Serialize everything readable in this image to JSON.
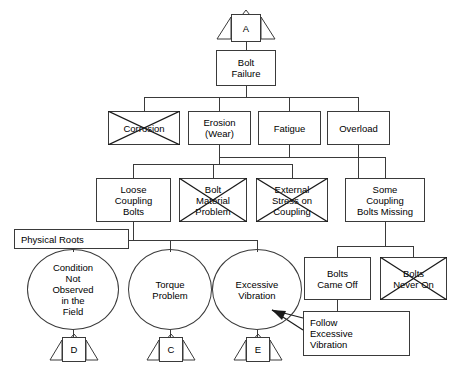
{
  "diagram": {
    "type": "fault-tree",
    "stroke_color": "#3a3a3a",
    "text_color": "#000000",
    "background_color": "#ffffff",
    "crossed_out_meaning": "ruled out / eliminated cause"
  },
  "transfer_symbols": [
    {
      "id": "top",
      "label": "A",
      "position": "top",
      "x": 231,
      "y": 12
    },
    {
      "id": "d",
      "label": "D",
      "position": "bottom-left",
      "x": 65,
      "y": 337
    },
    {
      "id": "c",
      "label": "C",
      "position": "bottom-center",
      "x": 150,
      "y": 337
    },
    {
      "id": "e",
      "label": "E",
      "position": "bottom-right-of-center",
      "x": 234,
      "y": 337
    }
  ],
  "nodes": [
    {
      "id": "bolt-failure",
      "label": "Bolt\nFailure",
      "shape": "rect",
      "crossed": false,
      "x": 216,
      "y": 50,
      "w": 60,
      "h": 36
    },
    {
      "id": "corrosion",
      "label": "Corrosion",
      "shape": "rect",
      "crossed": true,
      "x": 108,
      "y": 111,
      "w": 72,
      "h": 34
    },
    {
      "id": "erosion-wear",
      "label": "Erosion\n(Wear)",
      "shape": "rect",
      "crossed": false,
      "x": 188,
      "y": 111,
      "w": 63,
      "h": 34
    },
    {
      "id": "fatigue",
      "label": "Fatigue",
      "shape": "rect",
      "crossed": false,
      "x": 258,
      "y": 111,
      "w": 63,
      "h": 34
    },
    {
      "id": "overload",
      "label": "Overload",
      "shape": "rect",
      "crossed": false,
      "x": 327,
      "y": 111,
      "w": 63,
      "h": 34
    },
    {
      "id": "loose-coupling-bolts",
      "label": "Loose\nCoupling\nBolts",
      "shape": "rect",
      "crossed": false,
      "x": 96,
      "y": 178,
      "w": 75,
      "h": 44
    },
    {
      "id": "bolt-material-problem",
      "label": "Bolt\nMaterial\nProblem",
      "shape": "rect",
      "crossed": true,
      "x": 179,
      "y": 178,
      "w": 68,
      "h": 44
    },
    {
      "id": "external-stress-on-coupling",
      "label": "External\nStress on\nCoupling",
      "shape": "rect",
      "crossed": true,
      "x": 256,
      "y": 178,
      "w": 72,
      "h": 44
    },
    {
      "id": "some-coupling-bolts-missing",
      "label": "Some\nCoupling\nBolts Missing",
      "shape": "rect",
      "crossed": false,
      "x": 345,
      "y": 178,
      "w": 80,
      "h": 44
    },
    {
      "id": "physical-roots",
      "label": "Physical Roots",
      "shape": "rect",
      "crossed": false,
      "align": "left",
      "x": 14,
      "y": 229,
      "w": 115,
      "h": 20
    },
    {
      "id": "condition-not-observed",
      "label": "Condition\nNot\nObserved\nin the\nField",
      "shape": "oval",
      "crossed": false,
      "x": 27,
      "y": 249,
      "w": 92,
      "h": 81
    },
    {
      "id": "torque-problem",
      "label": "Torque\nProblem",
      "shape": "oval",
      "crossed": false,
      "x": 128,
      "y": 249,
      "w": 84,
      "h": 81
    },
    {
      "id": "excessive-vibration",
      "label": "Excessive\nVibration",
      "shape": "oval",
      "crossed": false,
      "x": 212,
      "y": 249,
      "w": 90,
      "h": 81
    },
    {
      "id": "bolts-came-off",
      "label": "Bolts\nCame Off",
      "shape": "rect",
      "crossed": false,
      "x": 304,
      "y": 257,
      "w": 67,
      "h": 43
    },
    {
      "id": "bolts-never-on",
      "label": "Bolts\nNever On",
      "shape": "rect",
      "crossed": true,
      "x": 380,
      "y": 257,
      "w": 67,
      "h": 43
    },
    {
      "id": "follow-excessive-vibration",
      "label": "Follow\nExcessive\nVibration",
      "shape": "rect",
      "crossed": false,
      "align": "left",
      "x": 303,
      "y": 311,
      "w": 107,
      "h": 45
    }
  ],
  "annotation_arrow": {
    "from": "follow-excessive-vibration",
    "to": "excessive-vibration",
    "description": "arrow pointing from Follow Excessive Vibration box to Excessive Vibration oval"
  }
}
